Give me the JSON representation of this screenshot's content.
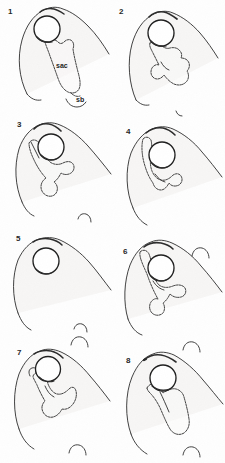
{
  "figure": {
    "background_color": "#fefefe",
    "ink_color": "#2b2b2b",
    "fill_color": "#f3f2f1",
    "panel_count": 8,
    "columns": 2,
    "rows": 4
  },
  "panels": [
    {
      "number": "1",
      "has_inner_structure": true,
      "has_circle": true,
      "labels": [
        {
          "name": "sac",
          "text": "sac"
        },
        {
          "name": "sb",
          "text": "sb"
        }
      ]
    },
    {
      "number": "2",
      "has_inner_structure": true,
      "has_circle": true,
      "labels": []
    },
    {
      "number": "3",
      "has_inner_structure": true,
      "has_circle": true,
      "labels": []
    },
    {
      "number": "4",
      "has_inner_structure": true,
      "has_circle": true,
      "labels": []
    },
    {
      "number": "5",
      "has_inner_structure": false,
      "has_circle": true,
      "labels": []
    },
    {
      "number": "6",
      "has_inner_structure": true,
      "has_circle": true,
      "labels": []
    },
    {
      "number": "7",
      "has_inner_structure": true,
      "has_circle": true,
      "labels": []
    },
    {
      "number": "8",
      "has_inner_structure": true,
      "has_circle": true,
      "labels": []
    }
  ],
  "annotations": {
    "sac_label": "sac",
    "sb_label": "sb"
  }
}
